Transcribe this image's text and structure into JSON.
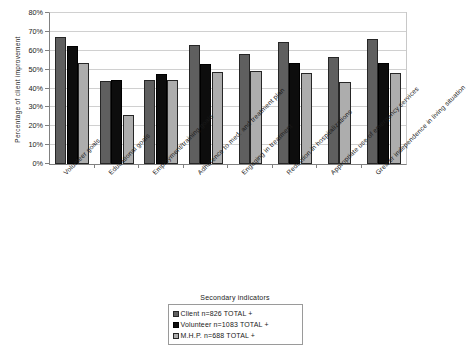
{
  "chart_data": {
    "type": "bar",
    "title": "",
    "xlabel": "",
    "ylabel": "Percentage of client improvement",
    "ylim": [
      0,
      80
    ],
    "ytick_labels": [
      "0%",
      "10%",
      "20%",
      "30%",
      "40%",
      "50%",
      "60%",
      "70%",
      "80%"
    ],
    "ytick_values": [
      0,
      10,
      20,
      30,
      40,
      50,
      60,
      70,
      80
    ],
    "grid": true,
    "legend_position": "bottom",
    "legend_title": "Secondary indicators",
    "categories": [
      "Volunteer goals",
      "Educational goals",
      "Employment/training goals",
      "Adherence to med. and treatment plan",
      "Engaging in treatment",
      "Reduction in hospitalizations",
      "Appropriate use of emergency services",
      "Greater independence in living situation"
    ],
    "series": [
      {
        "name": "Client n=826 TOTAL +",
        "color": "#5f5f5f",
        "values": [
          67.5,
          44.0,
          44.5,
          63.0,
          58.5,
          64.5,
          56.5,
          66.0
        ]
      },
      {
        "name": "Volunteer n=1083 TOTAL +",
        "color": "#0d0d0d",
        "values": [
          62.5,
          44.5,
          47.5,
          53.0,
          null,
          53.5,
          null,
          53.5
        ]
      },
      {
        "name": "M.H.P. n=688 TOTAL +",
        "color": "#adadad",
        "values": [
          53.5,
          26.0,
          44.5,
          49.0,
          49.5,
          48.0,
          43.5,
          48.0
        ]
      }
    ]
  },
  "legend": {
    "title": "Secondary indicators",
    "items": [
      {
        "label": "Client n=826 TOTAL +",
        "swatch": "dark-gray-swatch"
      },
      {
        "label": "Volunteer n=1083 TOTAL +",
        "swatch": "black-swatch"
      },
      {
        "label": "M.H.P. n=688 TOTAL +",
        "swatch": "light-gray-swatch"
      }
    ]
  }
}
